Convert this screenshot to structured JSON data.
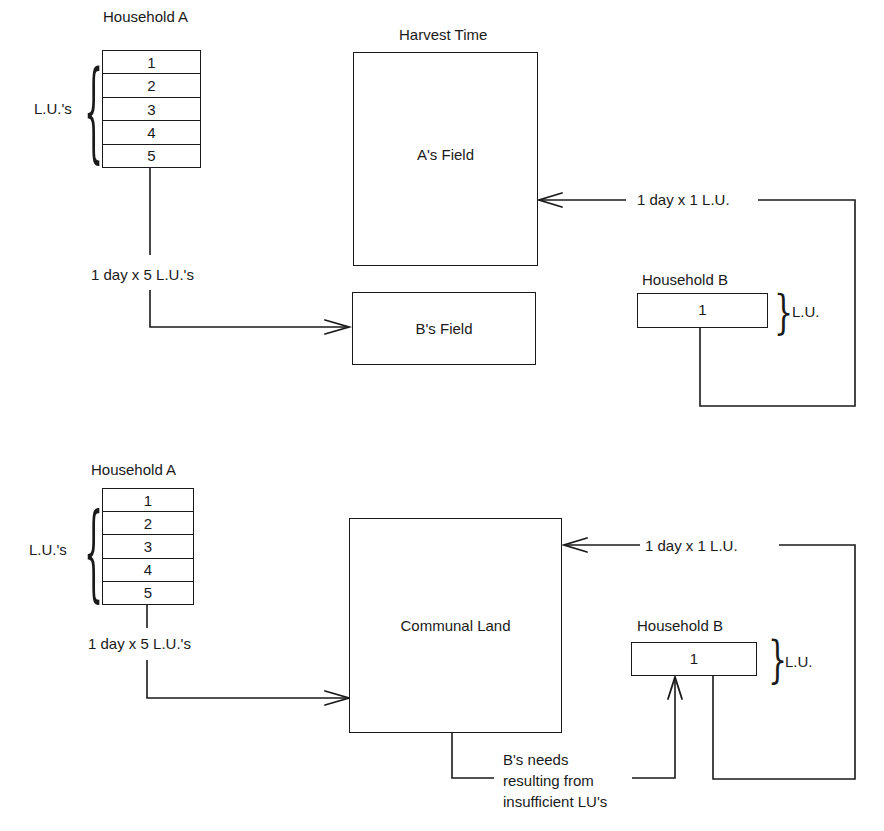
{
  "top_diagram": {
    "title": "Harvest Time",
    "household_a": {
      "label": "Household A",
      "units": [
        "1",
        "2",
        "3",
        "4",
        "5"
      ],
      "brace_label": "L.U.'s"
    },
    "flow_a_to_b_field": "1 day x 5 L.U.'s",
    "a_field": "A's Field",
    "b_field": "B's Field",
    "flow_b_to_a_field": "1 day x 1 L.U.",
    "household_b": {
      "label": "Household B",
      "units": [
        "1"
      ],
      "brace_label": "L.U."
    }
  },
  "bottom_diagram": {
    "household_a": {
      "label": "Household A",
      "units": [
        "1",
        "2",
        "3",
        "4",
        "5"
      ],
      "brace_label": "L.U.'s"
    },
    "flow_a_to_communal": "1 day x 5 L.U.'s",
    "communal_land": "Communal Land",
    "flow_b_to_communal": "1 day x 1 L.U.",
    "household_b": {
      "label": "Household B",
      "units": [
        "1"
      ],
      "brace_label": "L.U."
    },
    "needs_note": [
      "B's needs",
      "resulting from",
      "insufficient LU's"
    ]
  }
}
